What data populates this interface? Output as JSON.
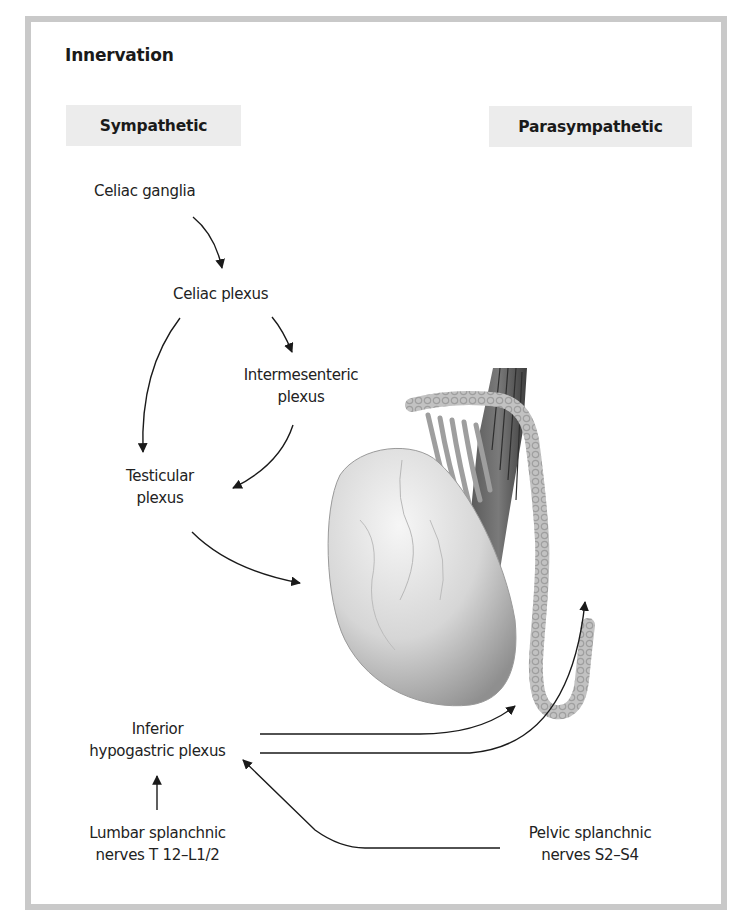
{
  "figure": {
    "title": "Innervation",
    "columns": {
      "sympathetic": "Sympathetic",
      "parasympathetic": "Parasympathetic"
    },
    "nodes": {
      "celiac_ganglia": "Celiac ganglia",
      "celiac_plexus": "Celiac plexus",
      "intermesenteric_plexus": [
        "Intermesenteric",
        "plexus"
      ],
      "testicular_plexus": [
        "Testicular",
        "plexus"
      ],
      "inferior_hypogastric_plexus": [
        "Inferior",
        "hypogastric plexus"
      ],
      "lumbar_splanchnic": [
        "Lumbar splanchnic",
        "nerves T 12–L1/2"
      ],
      "pelvic_splanchnic": [
        "Pelvic splanchnic",
        "nerves S2–S4"
      ]
    },
    "edges": [
      {
        "from": "Celiac ganglia",
        "to": "Celiac plexus"
      },
      {
        "from": "Celiac plexus",
        "to": "Testicular plexus"
      },
      {
        "from": "Celiac plexus",
        "to": "Intermesenteric plexus"
      },
      {
        "from": "Intermesenteric plexus",
        "to": "Testicular plexus"
      },
      {
        "from": "Testicular plexus",
        "to": "Testis"
      },
      {
        "from": "Inferior hypogastric plexus",
        "to": "Epididymis (tail)"
      },
      {
        "from": "Inferior hypogastric plexus",
        "to": "Ductus deferens"
      },
      {
        "from": "Lumbar splanchnic nerves T 12–L1/2",
        "to": "Inferior hypogastric plexus"
      },
      {
        "from": "Pelvic splanchnic nerves S2–S4",
        "to": "Inferior hypogastric plexus"
      }
    ],
    "illustration": "testis-epididymis-spermatic-cord",
    "colors": {
      "frame": "#c9c9c9",
      "header_bg": "#ececec",
      "text": "#1e1e1e",
      "arrow": "#1a1a1a"
    }
  }
}
